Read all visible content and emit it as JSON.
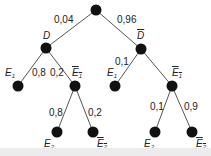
{
  "diagram": {
    "type": "probability-tree",
    "edges": {
      "root_D": "0,04",
      "root_notD": "0,96",
      "D_E1": "0,8",
      "D_notE1": "0,2",
      "notD_E1": "0,1",
      "DnotE1_E2": "0,8",
      "DnotE1_notE2": "0,2",
      "notDnotE1_E2": "0,1",
      "notDnotE1_notE2": "0,9"
    },
    "nodes": {
      "D": "D",
      "notD": "D",
      "E": "E",
      "sub1": "1",
      "sub2": "2"
    },
    "colors": {
      "node": "#111111",
      "line": "#555555",
      "text": "#222222"
    }
  }
}
